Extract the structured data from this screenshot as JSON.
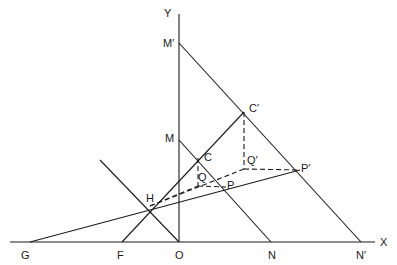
{
  "diagram": {
    "axes": {
      "x_label": "X",
      "y_label": "Y"
    },
    "points": {
      "O": {
        "label": "O",
        "x": 179,
        "y": 242,
        "lx": 175,
        "ly": 249
      },
      "G": {
        "label": "G",
        "x": 30,
        "y": 242,
        "lx": 21,
        "ly": 249
      },
      "F": {
        "label": "F",
        "x": 122,
        "y": 242,
        "lx": 117,
        "ly": 249
      },
      "N": {
        "label": "N",
        "x": 271,
        "y": 242,
        "lx": 268,
        "ly": 249
      },
      "Np": {
        "label": "N′",
        "x": 361,
        "y": 242,
        "lx": 356,
        "ly": 249
      },
      "Mp": {
        "label": "M′",
        "x": 179,
        "y": 43,
        "lx": 164,
        "ly": 38
      },
      "M": {
        "label": "M",
        "x": 179,
        "y": 140,
        "lx": 166,
        "ly": 134
      },
      "Cp": {
        "label": "C′",
        "x": 244,
        "y": 112,
        "lx": 249,
        "ly": 103
      },
      "C": {
        "label": "C",
        "x": 198,
        "y": 158,
        "lx": 204,
        "ly": 153
      },
      "Qp": {
        "label": "Q′",
        "x": 244,
        "y": 169,
        "lx": 247,
        "ly": 155
      },
      "Q": {
        "label": "Q",
        "x": 198,
        "y": 186,
        "lx": 198,
        "ly": 172
      },
      "Pp": {
        "label": "P′",
        "x": 300,
        "y": 170,
        "lx": 300,
        "ly": 164
      },
      "P": {
        "label": "P",
        "x": 226,
        "y": 187,
        "lx": 227,
        "ly": 181
      },
      "H": {
        "label": "H",
        "x": 150,
        "y": 206,
        "lx": 146,
        "ly": 193
      }
    },
    "stroke_color": "#1a1a1a",
    "background": "#ffffff"
  }
}
